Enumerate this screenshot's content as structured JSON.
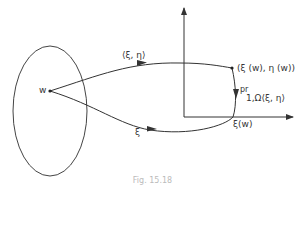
{
  "diagram": {
    "labels": {
      "point_w": "w",
      "upper_map": "⟨ξ, η⟩",
      "lower_map": "ξ",
      "image_point": "(ξ (w), η (w))",
      "projection": "pr",
      "projection_sub": "1,Ω⟨ξ, η⟩",
      "xi_w": "ξ(w)"
    },
    "caption": "Fig. 15.18",
    "colors": {
      "stroke": "#333333",
      "background": "#ffffff"
    }
  }
}
